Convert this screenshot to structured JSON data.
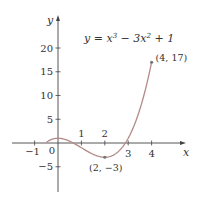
{
  "chart_data": {
    "type": "line",
    "function": "y = x^3 - 3x^2 + 1",
    "xlabel": "x",
    "ylabel": "y",
    "xlim": [
      -1.5,
      5.2
    ],
    "ylim": [
      -9,
      25
    ],
    "domain": [
      -0.5,
      4
    ],
    "x_ticks": [
      -1,
      0,
      1,
      2,
      3,
      4
    ],
    "x_tick_labels": [
      "−1",
      "0",
      "1",
      "2",
      "3",
      "4"
    ],
    "y_ticks": [
      -5,
      5,
      10,
      15,
      20
    ],
    "y_tick_labels": [
      "−5",
      "5",
      "10",
      "15",
      "20"
    ],
    "grid": false,
    "legend": null,
    "series": [
      {
        "name": "y = x³ − 3x² + 1",
        "x": [
          -0.5,
          0,
          0.5,
          1,
          1.5,
          2,
          2.5,
          3,
          3.5,
          4
        ],
        "y": [
          0.125,
          1,
          0.375,
          -1,
          -2.375,
          -3,
          -2.125,
          1,
          7.125,
          17
        ]
      }
    ],
    "annotations": [
      {
        "label": "(4, 17)",
        "x": 4,
        "y": 17
      },
      {
        "label": "(2, −3)",
        "x": 2,
        "y": -3
      }
    ],
    "colors": {
      "curve": "#b58a8a",
      "axis": "#444444",
      "point": "#777777"
    }
  }
}
